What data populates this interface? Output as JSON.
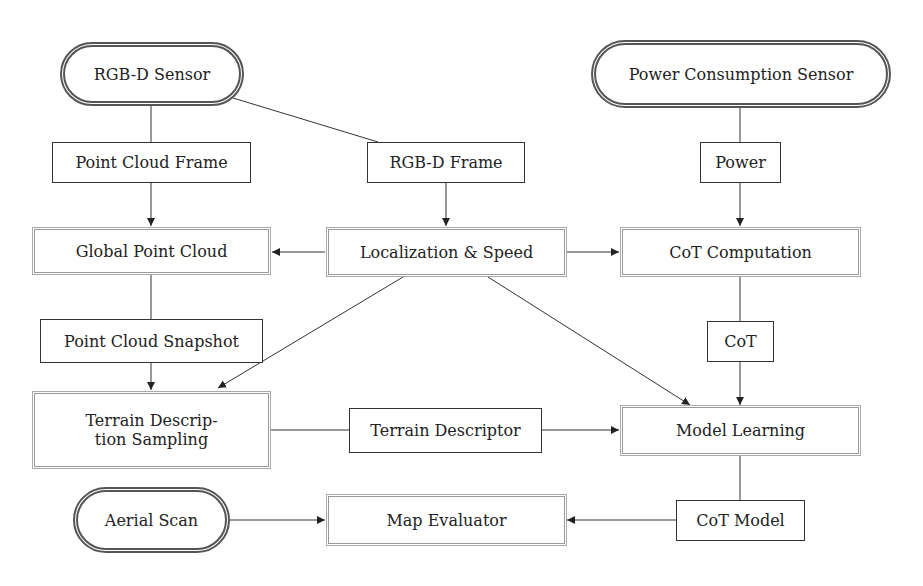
{
  "diagram": {
    "nodes": {
      "rgbd_sensor": {
        "label": "RGB-D Sensor",
        "shape": "terminal"
      },
      "power_sensor": {
        "label": "Power Consumption Sensor",
        "shape": "terminal"
      },
      "point_cloud_frame": {
        "label": "Point Cloud Frame",
        "shape": "data"
      },
      "rgbd_frame": {
        "label": "RGB-D Frame",
        "shape": "data"
      },
      "power": {
        "label": "Power",
        "shape": "data"
      },
      "global_point_cloud": {
        "label": "Global Point Cloud",
        "shape": "process"
      },
      "localization_speed": {
        "label": "Localization & Speed",
        "shape": "process"
      },
      "cot_computation": {
        "label": "CoT Computation",
        "shape": "process"
      },
      "point_cloud_snapshot": {
        "label": "Point Cloud Snapshot",
        "shape": "data"
      },
      "cot": {
        "label": "CoT",
        "shape": "data"
      },
      "terrain_description_sampling": {
        "label": "Terrain Descrip- tion Sampling",
        "line1": "Terrain Descrip-",
        "line2": "tion Sampling",
        "shape": "process"
      },
      "terrain_descriptor": {
        "label": "Terrain Descriptor",
        "shape": "data"
      },
      "model_learning": {
        "label": "Model Learning",
        "shape": "process"
      },
      "aerial_scan": {
        "label": "Aerial Scan",
        "shape": "terminal"
      },
      "map_evaluator": {
        "label": "Map Evaluator",
        "shape": "process"
      },
      "cot_model": {
        "label": "CoT Model",
        "shape": "data"
      }
    },
    "edges": [
      {
        "from": "RGB-D Sensor",
        "to": "Point Cloud Frame",
        "arrow": false
      },
      {
        "from": "RGB-D Sensor",
        "to": "RGB-D Frame",
        "arrow": false
      },
      {
        "from": "Point Cloud Frame",
        "to": "Global Point Cloud",
        "arrow": true
      },
      {
        "from": "RGB-D Frame",
        "to": "Localization & Speed",
        "arrow": true
      },
      {
        "from": "Power Consumption Sensor",
        "to": "Power",
        "arrow": false
      },
      {
        "from": "Power",
        "to": "CoT Computation",
        "arrow": true
      },
      {
        "from": "Localization & Speed",
        "to": "Global Point Cloud",
        "arrow": true
      },
      {
        "from": "Localization & Speed",
        "to": "CoT Computation",
        "arrow": true
      },
      {
        "from": "Localization & Speed",
        "to": "Terrain Description Sampling",
        "arrow": true
      },
      {
        "from": "Localization & Speed",
        "to": "Model Learning",
        "arrow": true
      },
      {
        "from": "Global Point Cloud",
        "to": "Point Cloud Snapshot",
        "arrow": false
      },
      {
        "from": "Point Cloud Snapshot",
        "to": "Terrain Description Sampling",
        "arrow": true
      },
      {
        "from": "CoT Computation",
        "to": "CoT",
        "arrow": false
      },
      {
        "from": "CoT",
        "to": "Model Learning",
        "arrow": true
      },
      {
        "from": "Terrain Description Sampling",
        "to": "Terrain Descriptor",
        "arrow": false
      },
      {
        "from": "Terrain Descriptor",
        "to": "Model Learning",
        "arrow": true
      },
      {
        "from": "Model Learning",
        "to": "CoT Model",
        "arrow": false
      },
      {
        "from": "CoT Model",
        "to": "Map Evaluator",
        "arrow": true
      },
      {
        "from": "Aerial Scan",
        "to": "Map Evaluator",
        "arrow": true
      }
    ],
    "colors": {
      "line": "#333333",
      "process_border": "#999999",
      "terminal_border": "#555555",
      "background": "#ffffff"
    }
  }
}
